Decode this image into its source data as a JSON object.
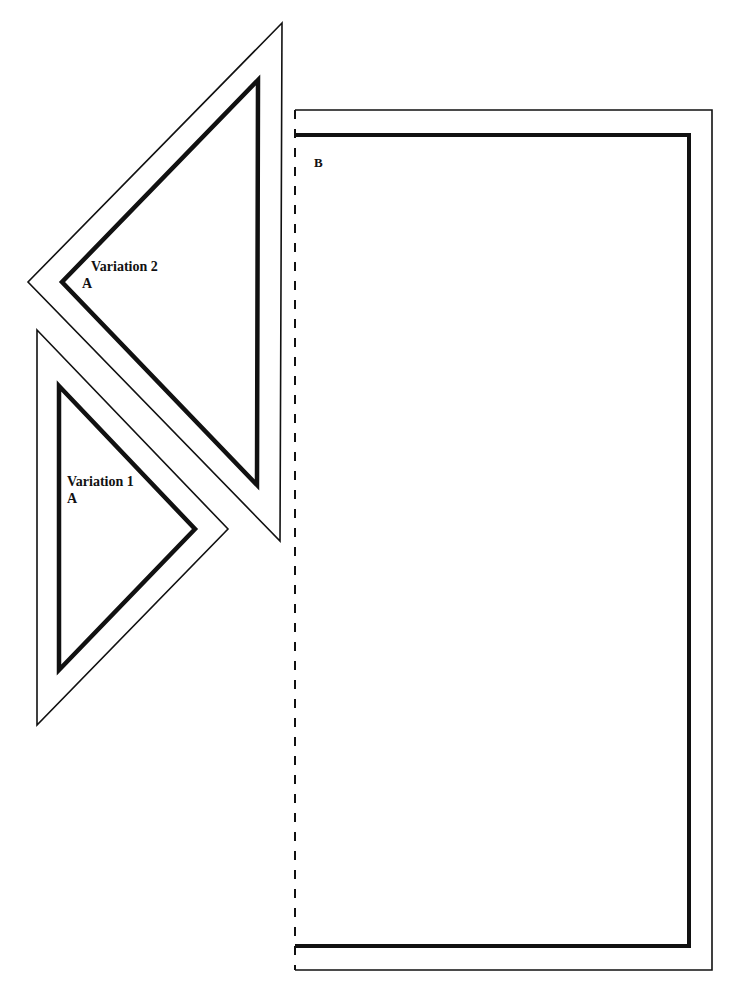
{
  "diagram": {
    "stroke_color": "#111111",
    "background": "#ffffff",
    "pieces": [
      {
        "id": "variation-2",
        "label": "Variation 2",
        "piece_letter": "A",
        "outer": [
          [
            282,
            23
          ],
          [
            28,
            282
          ],
          [
            280,
            541
          ]
        ],
        "inner": [
          [
            258,
            80
          ],
          [
            62,
            282
          ],
          [
            257,
            485
          ]
        ]
      },
      {
        "id": "variation-1",
        "label": "Variation 1",
        "piece_letter": "A",
        "outer": [
          [
            37,
            330
          ],
          [
            228,
            529
          ],
          [
            37,
            725
          ]
        ],
        "inner": [
          [
            59,
            386
          ],
          [
            195,
            529
          ],
          [
            59,
            670
          ]
        ]
      },
      {
        "id": "rectangle-b",
        "piece_letter": "B",
        "outer": {
          "x": 295,
          "y": 110,
          "w": 417,
          "h": 860
        },
        "inner": {
          "x": 295,
          "y": 135,
          "w": 394,
          "h": 811
        },
        "fold_line": "dashed-left-edge"
      }
    ]
  },
  "footer": {
    "left_text": "",
    "right_text": ""
  }
}
